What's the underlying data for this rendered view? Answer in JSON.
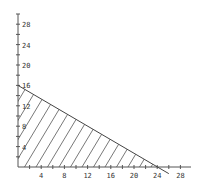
{
  "chart_data": {
    "type": "area",
    "title": "",
    "xlabel": "",
    "ylabel": "",
    "xlim": [
      0,
      29
    ],
    "ylim": [
      0,
      30
    ],
    "grid": false,
    "x_ticks": [
      4,
      8,
      12,
      16,
      20,
      24,
      28
    ],
    "y_ticks": [
      4,
      8,
      12,
      16,
      20,
      24,
      28
    ],
    "x_tick_labels": [
      "4",
      "8",
      "12",
      "16",
      "20",
      "24",
      "28"
    ],
    "y_tick_labels": [
      "4",
      "8",
      "12",
      "16",
      "20",
      "24",
      "28"
    ],
    "series": [
      {
        "name": "boundary line",
        "type": "line",
        "points": [
          [
            0,
            16
          ],
          [
            24,
            0
          ],
          [
            26,
            -1.3
          ]
        ]
      },
      {
        "name": "feasible region (hatched)",
        "type": "hatched-area",
        "polygon": [
          [
            0,
            0
          ],
          [
            0,
            16
          ],
          [
            24,
            0
          ]
        ]
      }
    ],
    "colors": {
      "axis": "#555555",
      "line": "#444444",
      "hatch": "#555555",
      "background": "#ffffff"
    }
  }
}
